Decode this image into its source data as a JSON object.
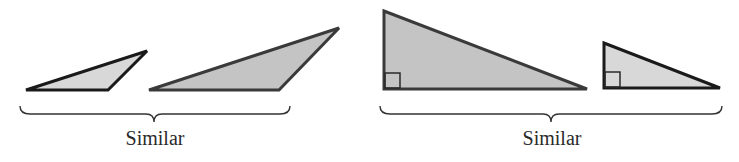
{
  "groups": [
    {
      "id": "oblique-pair",
      "label": "Similar",
      "triangles": [
        {
          "name": "small-oblique-triangle",
          "kind": "obtuse",
          "shade": "light"
        },
        {
          "name": "large-oblique-triangle",
          "kind": "obtuse",
          "shade": "dark"
        }
      ]
    },
    {
      "id": "right-pair",
      "label": "Similar",
      "triangles": [
        {
          "name": "large-right-triangle",
          "kind": "right",
          "shade": "dark",
          "right_angle_marker": true
        },
        {
          "name": "small-right-triangle",
          "kind": "right",
          "shade": "light",
          "right_angle_marker": true
        }
      ]
    }
  ],
  "colors": {
    "fill_light": "#d8d8d8",
    "fill_dark": "#c4c4c4",
    "stroke": "#1a1a1a",
    "text": "#2a2a2a"
  }
}
